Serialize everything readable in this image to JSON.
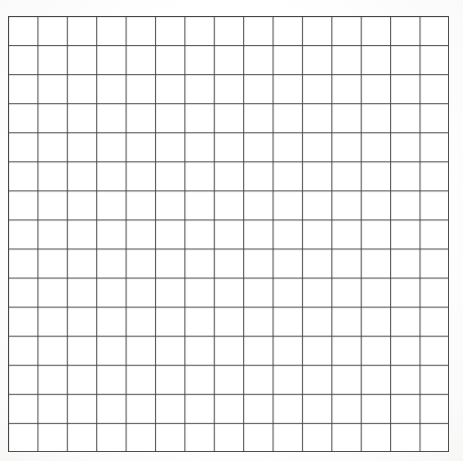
{
  "document": {
    "kind": "grid-paper-sheet",
    "title": "Blank square grid sheet",
    "background_color": "#fefefe",
    "line_color": "#464648"
  },
  "chart_data": {
    "type": "table",
    "title": "",
    "subtitle": "",
    "xlabel": "",
    "ylabel": "",
    "columns": 15,
    "rows": 15,
    "cell_width_px": 29.4,
    "cell_height_px": 29.07,
    "grid": true,
    "legend": null,
    "annotations": [],
    "column_headers": [
      "1",
      "2",
      "3",
      "4",
      "5",
      "6",
      "7",
      "8",
      "9",
      "10",
      "11",
      "12",
      "13",
      "14",
      "15"
    ],
    "row_headers": [
      "1",
      "2",
      "3",
      "4",
      "5",
      "6",
      "7",
      "8",
      "9",
      "10",
      "11",
      "12",
      "13",
      "14",
      "15"
    ],
    "values": [
      [
        "",
        "",
        "",
        "",
        "",
        "",
        "",
        "",
        "",
        "",
        "",
        "",
        "",
        "",
        ""
      ],
      [
        "",
        "",
        "",
        "",
        "",
        "",
        "",
        "",
        "",
        "",
        "",
        "",
        "",
        "",
        ""
      ],
      [
        "",
        "",
        "",
        "",
        "",
        "",
        "",
        "",
        "",
        "",
        "",
        "",
        "",
        "",
        ""
      ],
      [
        "",
        "",
        "",
        "",
        "",
        "",
        "",
        "",
        "",
        "",
        "",
        "",
        "",
        "",
        ""
      ],
      [
        "",
        "",
        "",
        "",
        "",
        "",
        "",
        "",
        "",
        "",
        "",
        "",
        "",
        "",
        ""
      ],
      [
        "",
        "",
        "",
        "",
        "",
        "",
        "",
        "",
        "",
        "",
        "",
        "",
        "",
        "",
        ""
      ],
      [
        "",
        "",
        "",
        "",
        "",
        "",
        "",
        "",
        "",
        "",
        "",
        "",
        "",
        "",
        ""
      ],
      [
        "",
        "",
        "",
        "",
        "",
        "",
        "",
        "",
        "",
        "",
        "",
        "",
        "",
        "",
        ""
      ],
      [
        "",
        "",
        "",
        "",
        "",
        "",
        "",
        "",
        "",
        "",
        "",
        "",
        "",
        "",
        ""
      ],
      [
        "",
        "",
        "",
        "",
        "",
        "",
        "",
        "",
        "",
        "",
        "",
        "",
        "",
        "",
        ""
      ],
      [
        "",
        "",
        "",
        "",
        "",
        "",
        "",
        "",
        "",
        "",
        "",
        "",
        "",
        "",
        ""
      ],
      [
        "",
        "",
        "",
        "",
        "",
        "",
        "",
        "",
        "",
        "",
        "",
        "",
        "",
        "",
        ""
      ],
      [
        "",
        "",
        "",
        "",
        "",
        "",
        "",
        "",
        "",
        "",
        "",
        "",
        "",
        "",
        ""
      ],
      [
        "",
        "",
        "",
        "",
        "",
        "",
        "",
        "",
        "",
        "",
        "",
        "",
        "",
        "",
        ""
      ],
      [
        "",
        "",
        "",
        "",
        "",
        "",
        "",
        "",
        "",
        "",
        "",
        "",
        "",
        "",
        ""
      ]
    ]
  },
  "geometry": {
    "offset_left_px": 8,
    "offset_top_px": 16,
    "width_px": 441,
    "height_px": 436
  }
}
